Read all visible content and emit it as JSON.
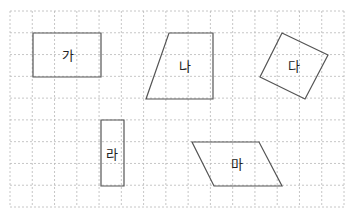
{
  "grid": {
    "x0": 10,
    "y0": 11,
    "x1": 344,
    "y1": 207,
    "cols": 15,
    "rows": 9,
    "line_color": "#b8b8b8"
  },
  "shape_stroke": "#555555",
  "shapes": [
    {
      "id": "ga",
      "label": "가",
      "type": "rectangle",
      "points": [
        [
          33,
          33
        ],
        [
          101,
          33
        ],
        [
          101,
          77
        ],
        [
          33,
          77
        ]
      ],
      "label_pos": [
        68,
        55
      ]
    },
    {
      "id": "na",
      "label": "나",
      "type": "trapezoid",
      "points": [
        [
          169,
          33
        ],
        [
          213,
          33
        ],
        [
          213,
          99
        ],
        [
          146,
          99
        ]
      ],
      "label_pos": [
        185,
        66
      ]
    },
    {
      "id": "da",
      "label": "다",
      "type": "rotated-square",
      "points": [
        [
          282,
          33
        ],
        [
          328,
          55
        ],
        [
          305,
          99
        ],
        [
          260,
          77
        ]
      ],
      "label_pos": [
        294,
        66
      ]
    },
    {
      "id": "ra",
      "label": "라",
      "type": "rectangle",
      "points": [
        [
          101,
          120
        ],
        [
          124,
          120
        ],
        [
          124,
          186
        ],
        [
          101,
          186
        ]
      ],
      "label_pos": [
        112,
        154
      ]
    },
    {
      "id": "ma",
      "label": "마",
      "type": "parallelogram",
      "points": [
        [
          192,
          142
        ],
        [
          259,
          142
        ],
        [
          282,
          186
        ],
        [
          214,
          186
        ]
      ],
      "label_pos": [
        237,
        164
      ]
    }
  ]
}
